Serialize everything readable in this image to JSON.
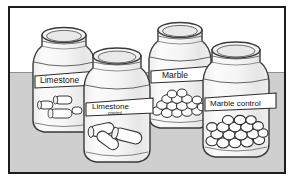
{
  "figure": {
    "kind": "line-drawing-illustration",
    "background_color": "#ffffff",
    "table_color": "#cfcfcf",
    "table_horizon_y": 64,
    "frame_color": "#1d1d1d",
    "glass_fill": "#f2f2f2",
    "outline_color": "#333333",
    "label_fill": "#ffffff",
    "chip_fill": "#fdfdfd"
  },
  "jars": [
    {
      "id": "jar-1",
      "row": "back",
      "label_primary": "Limestone",
      "label_secondary": "",
      "contents": "limestone chips",
      "content_shape": "cylinder",
      "chip_count": 4
    },
    {
      "id": "jar-2",
      "row": "front",
      "label_primary": "Limestone",
      "label_secondary": "control",
      "contents": "limestone chips",
      "content_shape": "cylinder",
      "chip_count": 3
    },
    {
      "id": "jar-3",
      "row": "back",
      "label_primary": "Marble",
      "label_secondary": "",
      "contents": "marble chips",
      "content_shape": "pebble",
      "chip_count": 16
    },
    {
      "id": "jar-4",
      "row": "front",
      "label_primary": "Marble control",
      "label_secondary": "",
      "contents": "marble chips",
      "content_shape": "pebble",
      "chip_count": 18
    }
  ]
}
